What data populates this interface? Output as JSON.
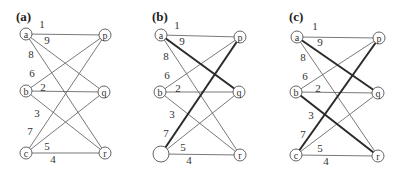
{
  "figure": {
    "panels": [
      {
        "id": "a",
        "label": "(a)",
        "label_pos": [
          16,
          21
        ],
        "nodes": [
          {
            "id": "a",
            "label": "a",
            "x": 26,
            "y": 34,
            "r": 6
          },
          {
            "id": "b",
            "label": "b",
            "x": 26,
            "y": 91,
            "r": 6
          },
          {
            "id": "c",
            "label": "c",
            "x": 26,
            "y": 153,
            "r": 6
          },
          {
            "id": "p",
            "label": "p",
            "x": 105,
            "y": 35,
            "r": 6
          },
          {
            "id": "q",
            "label": "q",
            "x": 104,
            "y": 92,
            "r": 6
          },
          {
            "id": "r",
            "label": "r",
            "x": 105,
            "y": 153,
            "r": 6
          }
        ],
        "edges": [
          {
            "from": "a",
            "to": "p",
            "weight": "1",
            "lx": 42,
            "ly": 24,
            "bold": false
          },
          {
            "from": "a",
            "to": "q",
            "weight": "9",
            "lx": 47,
            "ly": 40,
            "bold": false
          },
          {
            "from": "a",
            "to": "r",
            "weight": "8",
            "lx": 31,
            "ly": 54,
            "bold": false
          },
          {
            "from": "b",
            "to": "p",
            "weight": "6",
            "lx": 32,
            "ly": 73,
            "bold": false
          },
          {
            "from": "b",
            "to": "q",
            "weight": "2",
            "lx": 43,
            "ly": 87,
            "bold": false
          },
          {
            "from": "b",
            "to": "r",
            "weight": "3",
            "lx": 37,
            "ly": 113,
            "bold": false
          },
          {
            "from": "c",
            "to": "p",
            "weight": "7",
            "lx": 30,
            "ly": 131,
            "bold": false
          },
          {
            "from": "c",
            "to": "q",
            "weight": "5",
            "lx": 47,
            "ly": 146,
            "bold": false
          },
          {
            "from": "c",
            "to": "r",
            "weight": "4",
            "lx": 53,
            "ly": 159,
            "bold": false
          }
        ]
      },
      {
        "id": "b",
        "label": "(b)",
        "label_pos": [
          152,
          21
        ],
        "nodes": [
          {
            "id": "a",
            "label": "a",
            "x": 161,
            "y": 35,
            "r": 6
          },
          {
            "id": "b",
            "label": "b",
            "x": 160,
            "y": 92,
            "r": 6
          },
          {
            "id": "c",
            "label": "",
            "x": 161,
            "y": 154,
            "r": 8
          },
          {
            "id": "p",
            "label": "p",
            "x": 240,
            "y": 37,
            "r": 6
          },
          {
            "id": "q",
            "label": "q",
            "x": 239,
            "y": 92,
            "r": 6
          },
          {
            "id": "r",
            "label": "r",
            "x": 240,
            "y": 155,
            "r": 6
          }
        ],
        "edges": [
          {
            "from": "a",
            "to": "p",
            "weight": "1",
            "lx": 177,
            "ly": 25,
            "bold": false
          },
          {
            "from": "a",
            "to": "q",
            "weight": "9",
            "lx": 182,
            "ly": 41,
            "bold": true
          },
          {
            "from": "a",
            "to": "r",
            "weight": "8",
            "lx": 166,
            "ly": 56,
            "bold": false
          },
          {
            "from": "b",
            "to": "p",
            "weight": "6",
            "lx": 167,
            "ly": 75,
            "bold": false
          },
          {
            "from": "b",
            "to": "q",
            "weight": "2",
            "lx": 178,
            "ly": 88,
            "bold": false
          },
          {
            "from": "b",
            "to": "r",
            "weight": "3",
            "lx": 172,
            "ly": 114,
            "bold": false
          },
          {
            "from": "c",
            "to": "p",
            "weight": "7",
            "lx": 166,
            "ly": 133,
            "bold": true
          },
          {
            "from": "c",
            "to": "q",
            "weight": "5",
            "lx": 183,
            "ly": 147,
            "bold": false
          },
          {
            "from": "c",
            "to": "r",
            "weight": "4",
            "lx": 189,
            "ly": 160,
            "bold": false
          }
        ]
      },
      {
        "id": "c",
        "label": "(c)",
        "label_pos": [
          289,
          21
        ],
        "nodes": [
          {
            "id": "a",
            "label": "a",
            "x": 297,
            "y": 37,
            "r": 6
          },
          {
            "id": "b",
            "label": "b",
            "x": 296,
            "y": 92,
            "r": 6
          },
          {
            "id": "c",
            "label": "c",
            "x": 296,
            "y": 155,
            "r": 6
          },
          {
            "id": "p",
            "label": "p",
            "x": 379,
            "y": 38,
            "r": 6
          },
          {
            "id": "q",
            "label": "q",
            "x": 378,
            "y": 93,
            "r": 6
          },
          {
            "id": "r",
            "label": "r",
            "x": 378,
            "y": 156,
            "r": 6
          }
        ],
        "edges": [
          {
            "from": "a",
            "to": "p",
            "weight": "1",
            "lx": 315,
            "ly": 26,
            "bold": false
          },
          {
            "from": "a",
            "to": "q",
            "weight": "9",
            "lx": 320,
            "ly": 42,
            "bold": true
          },
          {
            "from": "a",
            "to": "r",
            "weight": "8",
            "lx": 303,
            "ly": 57,
            "bold": false
          },
          {
            "from": "b",
            "to": "p",
            "weight": "6",
            "lx": 305,
            "ly": 76,
            "bold": false
          },
          {
            "from": "b",
            "to": "q",
            "weight": "2",
            "lx": 318,
            "ly": 88,
            "bold": false
          },
          {
            "from": "b",
            "to": "r",
            "weight": "3",
            "lx": 311,
            "ly": 115,
            "bold": true
          },
          {
            "from": "c",
            "to": "p",
            "weight": "7",
            "lx": 303,
            "ly": 134,
            "bold": true
          },
          {
            "from": "c",
            "to": "q",
            "weight": "5",
            "lx": 320,
            "ly": 148,
            "bold": false
          },
          {
            "from": "c",
            "to": "r",
            "weight": "4",
            "lx": 326,
            "ly": 161,
            "bold": false
          }
        ]
      }
    ]
  }
}
